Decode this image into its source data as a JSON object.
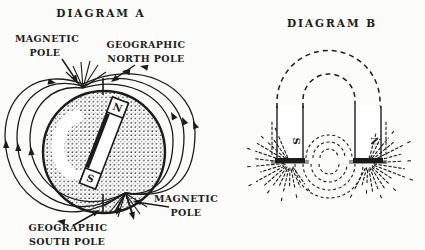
{
  "colors": {
    "ink": "#1c1c1c",
    "paper": "#fcfcfa"
  },
  "diagram_a": {
    "title": "DIAGRAM A",
    "magnet": {
      "north": "N",
      "south": "S"
    },
    "labels": {
      "magnetic_pole_top": [
        "MAGNETIC",
        "POLE"
      ],
      "geographic_north_pole": [
        "GEOGRAPHIC",
        "NORTH POLE"
      ],
      "geographic_south_pole": [
        "GEOGRAPHIC",
        "SOUTH POLE"
      ],
      "magnetic_pole_bottom": [
        "MAGNETIC",
        "POLE"
      ]
    }
  },
  "diagram_b": {
    "title": "DIAGRAM B",
    "poles": {
      "left": "S",
      "right": "N"
    }
  }
}
